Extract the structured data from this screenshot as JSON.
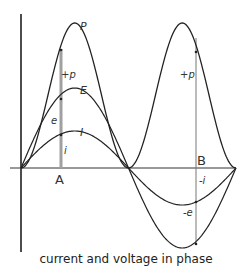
{
  "diagram": {
    "caption": "current and voltage in phase",
    "labels": {
      "P": "P",
      "E": "E",
      "I": "I",
      "plus_p_A": "+p",
      "e": "e",
      "i": "i",
      "A": "A",
      "plus_p_B": "+p",
      "B": "B",
      "minus_i": "-i",
      "minus_e": "-e"
    },
    "curves": [
      {
        "name": "power",
        "label": "P",
        "type": "sin^2",
        "peak_px": 23
      },
      {
        "name": "voltage",
        "label": "E",
        "type": "sin",
        "peak_px": 88
      },
      {
        "name": "current",
        "label": "I",
        "type": "sin",
        "peak_px": 131
      }
    ],
    "colors": {
      "line": "#222222",
      "bar": "#9a9a9a",
      "text": "#333333"
    }
  }
}
